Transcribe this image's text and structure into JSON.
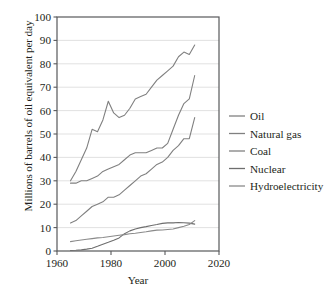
{
  "chart_data": {
    "type": "line",
    "title": "",
    "xlabel": "Year",
    "ylabel": "Millions of barrels of oil equivalent per day",
    "xlim": [
      1960,
      2020
    ],
    "ylim": [
      0,
      100
    ],
    "xticks": [
      1960,
      1980,
      2000,
      2020
    ],
    "yticks": [
      0,
      10,
      20,
      30,
      40,
      50,
      60,
      70,
      80,
      90,
      100
    ],
    "grid": "horizontal",
    "legend_position": "right",
    "x": [
      1965,
      1967,
      1969,
      1971,
      1973,
      1975,
      1977,
      1979,
      1981,
      1983,
      1985,
      1987,
      1989,
      1991,
      1993,
      1995,
      1997,
      1999,
      2001,
      2003,
      2005,
      2007,
      2009,
      2011
    ],
    "series": [
      {
        "name": "Oil",
        "color": "#808080",
        "values": [
          30,
          34,
          39,
          44,
          52,
          51,
          56,
          64,
          59,
          57,
          58,
          61,
          65,
          66,
          67,
          70,
          73,
          75,
          77,
          79,
          83,
          85,
          84,
          88
        ]
      },
      {
        "name": "Natural gas",
        "color": "#808080",
        "values": [
          12,
          13,
          15,
          17,
          19,
          20,
          21,
          23,
          23,
          24,
          26,
          28,
          30,
          32,
          33,
          35,
          37,
          38,
          40,
          43,
          45,
          48,
          48,
          57
        ]
      },
      {
        "name": "Coal",
        "color": "#808080",
        "values": [
          29,
          29,
          30,
          30,
          31,
          32,
          34,
          35,
          36,
          37,
          39,
          41,
          42,
          42,
          42,
          43,
          44,
          44,
          46,
          52,
          58,
          63,
          65,
          75
        ]
      },
      {
        "name": "Nuclear",
        "color": "#6e6e6e",
        "values": [
          0.2,
          0.3,
          0.5,
          0.8,
          1.2,
          2.0,
          2.9,
          3.7,
          4.6,
          5.6,
          7.4,
          8.6,
          9.4,
          10.0,
          10.4,
          10.9,
          11.3,
          11.8,
          12.0,
          12.0,
          12.2,
          12.1,
          11.9,
          11.5
        ]
      },
      {
        "name": "Hydroelectricity",
        "color": "#8a8a8a",
        "values": [
          4.0,
          4.4,
          4.7,
          5.0,
          5.3,
          5.6,
          5.8,
          6.1,
          6.4,
          6.7,
          7.0,
          7.4,
          7.6,
          7.9,
          8.2,
          8.6,
          8.9,
          9.0,
          9.2,
          9.4,
          10.0,
          10.6,
          11.3,
          13.0
        ]
      }
    ],
    "legend": [
      {
        "label": "Oil",
        "color": "#808080"
      },
      {
        "label": "Natural gas",
        "color": "#808080"
      },
      {
        "label": "Coal",
        "color": "#808080"
      },
      {
        "label": "Nuclear",
        "color": "#6e6e6e"
      },
      {
        "label": "Hydroelectricity",
        "color": "#8a8a8a"
      }
    ]
  }
}
